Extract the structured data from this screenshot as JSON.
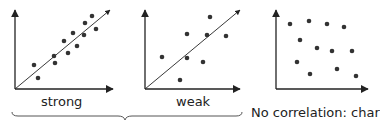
{
  "panels": [
    {
      "id": "strong",
      "label": "strong",
      "has_trend_line": true,
      "origin": [
        15,
        89
      ],
      "y_top": 10,
      "x_end": 113,
      "trend_end": [
        110,
        10
      ],
      "points": [
        [
          34,
          65
        ],
        [
          38,
          78
        ],
        [
          54,
          56
        ],
        [
          55,
          63
        ],
        [
          64,
          41
        ],
        [
          68,
          53
        ],
        [
          73,
          33
        ],
        [
          77,
          46
        ],
        [
          84,
          35
        ],
        [
          85,
          23
        ],
        [
          92,
          16
        ],
        [
          96,
          29
        ]
      ]
    },
    {
      "id": "weak",
      "label": "weak",
      "has_trend_line": true,
      "origin": [
        145,
        89
      ],
      "y_top": 10,
      "x_end": 240,
      "trend_end": [
        240,
        10
      ],
      "points": [
        [
          162,
          57
        ],
        [
          180,
          80
        ],
        [
          187,
          34
        ],
        [
          187,
          58
        ],
        [
          203,
          62
        ],
        [
          207,
          35
        ],
        [
          210,
          17
        ],
        [
          226,
          36
        ]
      ]
    },
    {
      "id": "none",
      "label": "No correlation: char",
      "has_trend_line": false,
      "origin": [
        276,
        89
      ],
      "y_top": 10,
      "x_end": 368,
      "points": [
        [
          290,
          24
        ],
        [
          309,
          21
        ],
        [
          327,
          24
        ],
        [
          344,
          27
        ],
        [
          300,
          40
        ],
        [
          317,
          48
        ],
        [
          332,
          51
        ],
        [
          352,
          51
        ],
        [
          297,
          62
        ],
        [
          310,
          74
        ],
        [
          337,
          69
        ],
        [
          356,
          76
        ]
      ]
    }
  ],
  "colors": {
    "axis": "#222222",
    "dot": "#333333",
    "brace": "#555555"
  }
}
